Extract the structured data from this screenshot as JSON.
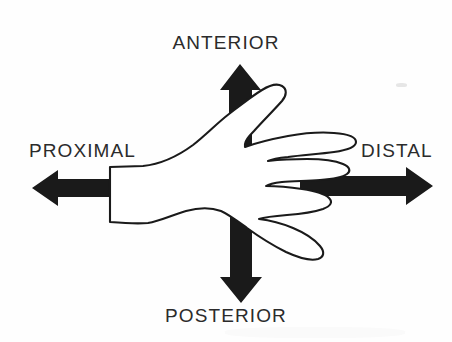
{
  "figure": {
    "background_color": "#fefefe",
    "ink_color": "#1a1a1a",
    "label_color": "#2b2b2b"
  },
  "labels": {
    "anterior": "ANTERIOR",
    "posterior": "POSTERIOR",
    "proximal": "PROXIMAL",
    "distal": "DISTAL"
  },
  "arrows": [
    {
      "name": "anterior-arrow",
      "direction": "up",
      "label": "ANTERIOR"
    },
    {
      "name": "posterior-arrow",
      "direction": "down",
      "label": "POSTERIOR"
    },
    {
      "name": "proximal-arrow",
      "direction": "left",
      "label": "PROXIMAL"
    },
    {
      "name": "distal-arrow",
      "direction": "right",
      "label": "DISTAL"
    }
  ]
}
